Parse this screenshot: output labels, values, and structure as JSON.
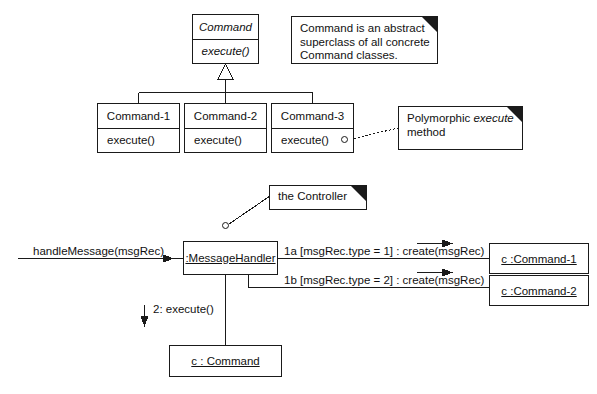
{
  "diagram": {
    "stroke_color": "#1a1a1a",
    "text_color": "#111111",
    "background": "#ffffff"
  },
  "class_hierarchy": {
    "superclass": {
      "name": "Command",
      "operation": "execute()"
    },
    "subclasses": [
      {
        "name": "Command-1",
        "operation": "execute()"
      },
      {
        "name": "Command-2",
        "operation": "execute()"
      },
      {
        "name": "Command-3",
        "operation": "execute()"
      }
    ]
  },
  "notes": [
    {
      "id": "abstract-superclass-note",
      "lines": [
        "Command is an abstract",
        "superclass of all concrete",
        "Command classes."
      ]
    },
    {
      "id": "polymorphic-note",
      "line_prefix": "Polymorphic ",
      "line_italic": "execute",
      "line_suffix": "",
      "line_second": "method"
    },
    {
      "id": "controller-note",
      "text": "the Controller"
    }
  ],
  "collaboration": {
    "handler": {
      "label": ":MessageHandler"
    },
    "incoming_message": "handleMessage(msgRec)",
    "messages": [
      {
        "id": "message-1a",
        "text": "1a [msgRec.type = 1] : create(msgRec)"
      },
      {
        "id": "message-1b",
        "text": "1b [msgRec.type = 2] : create(msgRec)"
      },
      {
        "id": "message-2",
        "text": "2: execute()"
      }
    ],
    "objects": [
      {
        "id": "object-command-1",
        "label": "c :Command-1"
      },
      {
        "id": "object-command-2",
        "label": "c :Command-2"
      },
      {
        "id": "object-command",
        "label": "c : Command"
      }
    ]
  }
}
